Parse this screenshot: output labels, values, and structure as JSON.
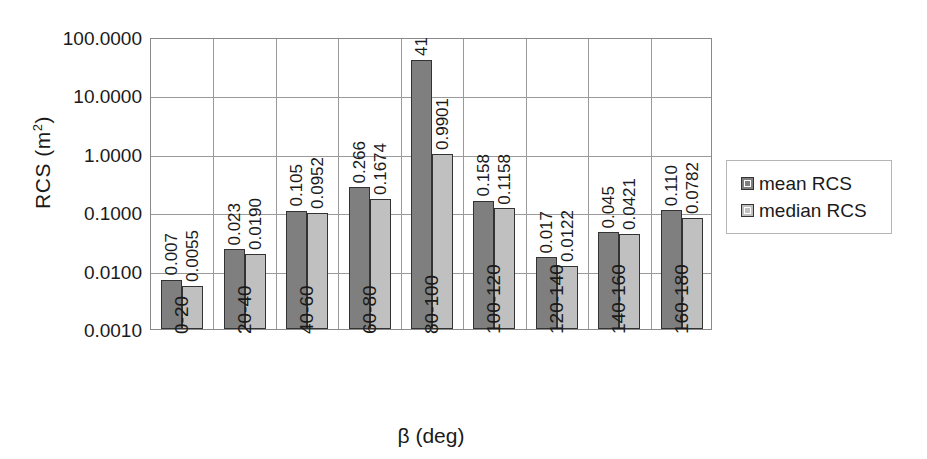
{
  "chart_data": {
    "type": "bar",
    "title": "",
    "subtitle": "",
    "xlabel": "β (deg)",
    "ylabel": "RCS (m²)",
    "ylabel_base": "RCS (m",
    "ylabel_sup": "2",
    "ylabel_close": ")",
    "yscale": "log",
    "ylim": [
      0.001,
      100.0
    ],
    "grid": true,
    "legend_position": "right",
    "categories": [
      "0-20",
      "20-40",
      "40-60",
      "60-80",
      "80-100",
      "100-120",
      "120-140",
      "140-160",
      "160-180"
    ],
    "ytick_labels": [
      "100.0000",
      "10.0000",
      "1.0000",
      "0.1000",
      "0.0100",
      "0.0010"
    ],
    "ytick_values": [
      100.0,
      10.0,
      1.0,
      0.1,
      0.01,
      0.001
    ],
    "series": [
      {
        "name": "mean RCS",
        "color": "#7f7f7f",
        "values": [
          0.007,
          0.023,
          0.105,
          0.266,
          41,
          0.158,
          0.017,
          0.045,
          0.11
        ],
        "labels": [
          "0.007",
          "0.023",
          "0.105",
          "0.266",
          "41",
          "0.158",
          "0.017",
          "0.045",
          "0.110"
        ]
      },
      {
        "name": "median RCS",
        "color": "#c0c0c0",
        "values": [
          0.0055,
          0.019,
          0.0952,
          0.1674,
          0.9901,
          0.1158,
          0.0122,
          0.0421,
          0.0782
        ],
        "labels": [
          "0.0055",
          "0.0190",
          "0.0952",
          "0.1674",
          "0.9901",
          "0.1158",
          "0.0122",
          "0.0421",
          "0.0782"
        ]
      }
    ]
  },
  "legend": {
    "items": [
      {
        "label": "mean RCS",
        "color": "#7f7f7f"
      },
      {
        "label": "median RCS",
        "color": "#c0c0c0"
      }
    ]
  },
  "colors": {
    "mean": "#7f7f7f",
    "median": "#c0c0c0",
    "axis": "#8a8a8a",
    "grid": "#9a9a9a",
    "text": "#1a1a1a",
    "background": "#ffffff"
  }
}
